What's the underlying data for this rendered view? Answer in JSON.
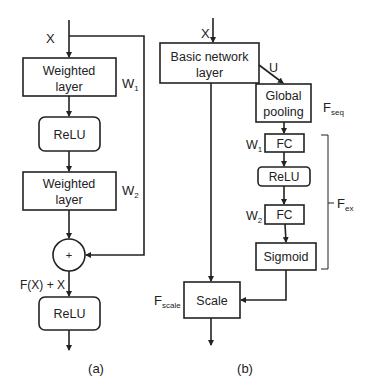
{
  "diagram_a": {
    "input_label": "X",
    "weighted_layer_1": {
      "line1": "Weighted",
      "line2": "layer",
      "weight": "W",
      "weight_sub": "1"
    },
    "relu_1": "ReLU",
    "weighted_layer_2": {
      "line1": "Weighted",
      "line2": "layer",
      "weight": "W",
      "weight_sub": "2"
    },
    "sum_symbol": "+",
    "sum_label": "F(X) + X",
    "relu_2": "ReLU",
    "caption": "(a)"
  },
  "diagram_b": {
    "input_label": "X",
    "basic_layer": {
      "line1": "Basic network",
      "line2": "layer"
    },
    "u_label": "U",
    "global_pooling": {
      "line1": "Global",
      "line2": "pooling"
    },
    "fseq": {
      "main": "F",
      "sub": "seq"
    },
    "fc_1": {
      "label": "FC",
      "weight": "W",
      "weight_sub": "1"
    },
    "relu": "ReLU",
    "fc_2": {
      "label": "FC",
      "weight": "W",
      "weight_sub": "2"
    },
    "sigmoid": "Sigmoid",
    "fex": {
      "main": "F",
      "sub": "ex"
    },
    "scale": "Scale",
    "fscale": {
      "main": "F",
      "sub": "scale"
    },
    "caption": "(b)"
  },
  "colors": {
    "stroke": "#222222",
    "background": "#ffffff"
  }
}
